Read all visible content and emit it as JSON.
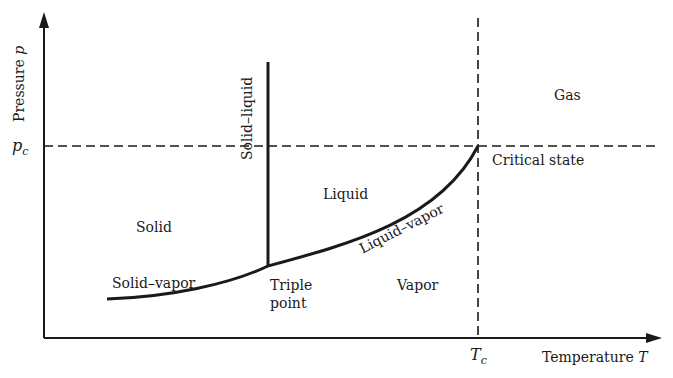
{
  "diagram": {
    "type": "phase-diagram",
    "axes": {
      "y_label": "Pressure",
      "y_symbol": "p",
      "x_label": "Temperature",
      "x_symbol": "T",
      "y_tick": "p",
      "y_tick_sub": "c",
      "x_tick": "T",
      "x_tick_sub": "c"
    },
    "regions": {
      "solid": "Solid",
      "liquid": "Liquid",
      "vapor": "Vapor",
      "gas": "Gas"
    },
    "curves": {
      "solid_liquid": "Solid–liquid",
      "solid_vapor": "Solid–vapor",
      "liquid_vapor": "Liquid–vapor"
    },
    "points": {
      "triple_line1": "Triple",
      "triple_line2": "point",
      "critical": "Critical state"
    },
    "colors": {
      "line": "#1a1a1a",
      "background": "#ffffff"
    }
  }
}
